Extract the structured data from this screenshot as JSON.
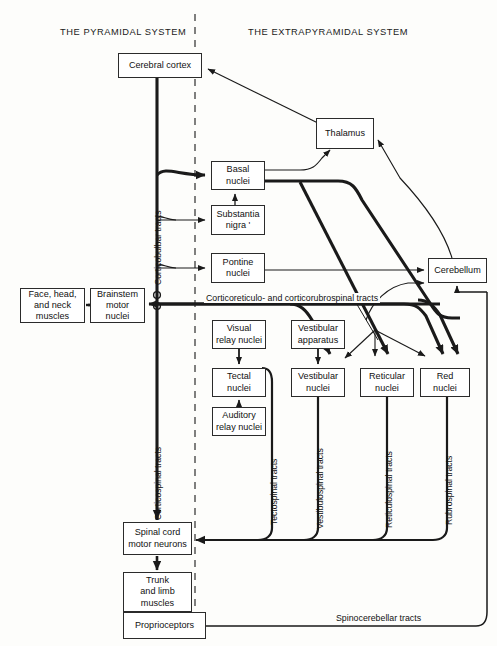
{
  "diagram": {
    "headers": {
      "left": "THE PYRAMIDAL SYSTEM",
      "right": "THE EXTRAPYRAMIDAL SYSTEM"
    },
    "nodes": [
      {
        "id": "cerebral-cortex",
        "label": "Cerebral cortex"
      },
      {
        "id": "thalamus",
        "label": "Thalamus"
      },
      {
        "id": "basal-nuclei",
        "label": "Basal\nnuclei"
      },
      {
        "id": "substantia-nigra",
        "label": "Substantia\nnigra '"
      },
      {
        "id": "pontine-nuclei",
        "label": "Pontine\nnuclei"
      },
      {
        "id": "cerebellum",
        "label": "Cerebellum"
      },
      {
        "id": "face-head-neck-muscles",
        "label": "Face, head,\nand neck\nmuscles"
      },
      {
        "id": "brainstem-motor-nuclei",
        "label": "Brainstem\nmotor\nnuclei"
      },
      {
        "id": "visual-relay-nuclei",
        "label": "Visual\nrelay nuclei"
      },
      {
        "id": "tectal-nuclei",
        "label": "Tectal\nnuclei"
      },
      {
        "id": "auditory-relay-nuclei",
        "label": "Auditory\nrelay nuclei"
      },
      {
        "id": "vestibular-apparatus",
        "label": "Vestibular\napparatus"
      },
      {
        "id": "vestibular-nuclei",
        "label": "Vestibular\nnuclei"
      },
      {
        "id": "reticular-nuclei",
        "label": "Reticular\nnuclei"
      },
      {
        "id": "red-nuclei",
        "label": "Red\nnuclei"
      },
      {
        "id": "spinal-cord-motor-neurons",
        "label": "Spinal cord\nmotor neurons"
      },
      {
        "id": "trunk-limb-muscles",
        "label": "Trunk\nand limb\nmuscles"
      },
      {
        "id": "proprioceptors",
        "label": "Proprioceptors"
      }
    ],
    "tract_labels": [
      {
        "id": "corticobulbar",
        "text": "Corticobulbar tracts",
        "orientation": "vertical"
      },
      {
        "id": "corticospinal",
        "text": "Corticospinal tracts",
        "orientation": "vertical"
      },
      {
        "id": "corticoreticulo",
        "text": "Corticoreticulo- and corticorubrospinal tracts",
        "orientation": "horizontal"
      },
      {
        "id": "tectospinal",
        "text": "Tectospinal tracts",
        "orientation": "vertical"
      },
      {
        "id": "vestibulospinal",
        "text": "Vestibulospinal tracts",
        "orientation": "vertical"
      },
      {
        "id": "reticulospinal",
        "text": "Reticulospinal tracts",
        "orientation": "vertical"
      },
      {
        "id": "rubrospinal",
        "text": "Rubrospinal tracts",
        "orientation": "vertical"
      },
      {
        "id": "spinocerebellar",
        "text": "Spinocerebellar tracts",
        "orientation": "horizontal"
      }
    ],
    "colors": {
      "line": "#1a1a1a",
      "box_border": "#2b2b2b",
      "background": "#fdfdfb",
      "divider": "#555555"
    }
  }
}
